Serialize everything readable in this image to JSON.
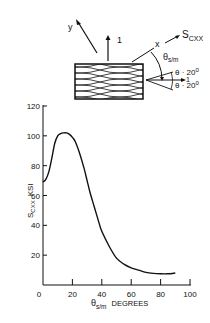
{
  "diagram": {
    "axis_y_label": "y",
    "axis_1_label": "1",
    "axis_x_label": "x",
    "stress_label": "S",
    "stress_sub": "CXX",
    "theta_label": "θ",
    "theta_sub": "s/m",
    "angle_upper": "θ · 20",
    "angle_upper_sup": "0",
    "angle_lower": "θ · 20",
    "angle_lower_sup": "0",
    "axis_1_right": "1"
  },
  "chart_data": {
    "type": "line",
    "title": "",
    "xlabel": "θs/m DEGREES",
    "ylabel": "SCXX KSI",
    "xlim": [
      0,
      100
    ],
    "ylim": [
      0,
      120
    ],
    "xticks": [
      0,
      20,
      40,
      60,
      80,
      100
    ],
    "yticks": [
      20,
      40,
      60,
      80,
      100,
      120
    ],
    "grid": false,
    "series": [
      {
        "name": "SCXX",
        "x": [
          0,
          2,
          4,
          6,
          8,
          10,
          12,
          14,
          16,
          18,
          20,
          22,
          25,
          28,
          30,
          32,
          35,
          38,
          40,
          45,
          50,
          55,
          60,
          65,
          70,
          75,
          80,
          85,
          90
        ],
        "y": [
          69,
          71,
          76,
          85,
          95,
          100,
          101.5,
          102,
          102,
          101,
          99,
          96,
          88,
          78,
          70,
          62,
          52,
          42,
          36,
          26,
          18,
          14,
          11.5,
          10,
          8.5,
          7.8,
          7.5,
          7.5,
          8
        ]
      }
    ]
  },
  "axis": {
    "y_ticks": [
      "20",
      "40",
      "60",
      "80",
      "100",
      "120"
    ],
    "x_ticks": [
      "0",
      "20",
      "40",
      "60",
      "80",
      "100"
    ],
    "y_label_main": "S",
    "y_label_sub": "CXX",
    "y_label_unit": "KSI",
    "x_label_main": "θ",
    "x_label_sub": "s/m",
    "x_label_unit": "DEGREES"
  }
}
